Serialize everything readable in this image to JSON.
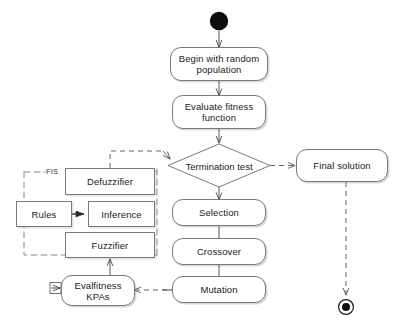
{
  "diagram": {
    "type": "uml-activity-diagram",
    "colors": {
      "background": "#ffffff",
      "node_border": "#7a7a7a",
      "node_fill": "#ffffff",
      "text": "#1a1a1a",
      "edge": "#555555",
      "dashed_edge": "#666666",
      "start_node": "#000000"
    },
    "nodes": {
      "start": {
        "label": "",
        "icon": "filled-circle-start-node"
      },
      "begin_population": {
        "label": "Begin with random population",
        "line1": "Begin with random",
        "line2": "population"
      },
      "evaluate_fitness": {
        "label": "Evaluate fitness function",
        "line1": "Evaluate fitness",
        "line2": "function"
      },
      "termination_test": {
        "label": "Termination test",
        "line1": "Termination",
        "line2": "test"
      },
      "final_solution": {
        "label": "Final solution"
      },
      "selection": {
        "label": "Selection"
      },
      "crossover": {
        "label": "Crossover"
      },
      "mutation": {
        "label": "Mutation"
      },
      "evalfitness_kpas": {
        "label": "Evalfitness KPAs",
        "line1": "Evalfitness",
        "line2": "KPAs"
      },
      "defuzzifier": {
        "label": "Defuzzifier"
      },
      "rules": {
        "label": "Rules"
      },
      "inference": {
        "label": "Inference"
      },
      "fuzzifier": {
        "label": "Fuzzifier"
      },
      "end": {
        "label": "",
        "icon": "final-node-circle-with-dot"
      }
    },
    "groups": {
      "fis": {
        "label": "FIS",
        "style": "dashed-boundary"
      }
    },
    "edges": [
      {
        "from": "start",
        "to": "begin_population",
        "style": "solid"
      },
      {
        "from": "begin_population",
        "to": "evaluate_fitness",
        "style": "solid"
      },
      {
        "from": "evaluate_fitness",
        "to": "termination_test",
        "style": "solid"
      },
      {
        "from": "termination_test",
        "to": "final_solution",
        "style": "dashed"
      },
      {
        "from": "termination_test",
        "to": "selection",
        "style": "solid"
      },
      {
        "from": "selection",
        "to": "crossover",
        "style": "solid"
      },
      {
        "from": "crossover",
        "to": "mutation",
        "style": "solid"
      },
      {
        "from": "mutation",
        "to": "evalfitness_kpas",
        "style": "dashed"
      },
      {
        "from": "evalfitness_kpas",
        "to": "fuzzifier",
        "style": "solid"
      },
      {
        "from": "rules",
        "to": "inference",
        "style": "solid"
      },
      {
        "from": "defuzzifier",
        "to": "termination_test",
        "style": "dashed"
      },
      {
        "from": "mutation",
        "to": "selection",
        "style": "solid-loop-left"
      },
      {
        "from": "final_solution",
        "to": "end",
        "style": "dashed"
      }
    ]
  }
}
